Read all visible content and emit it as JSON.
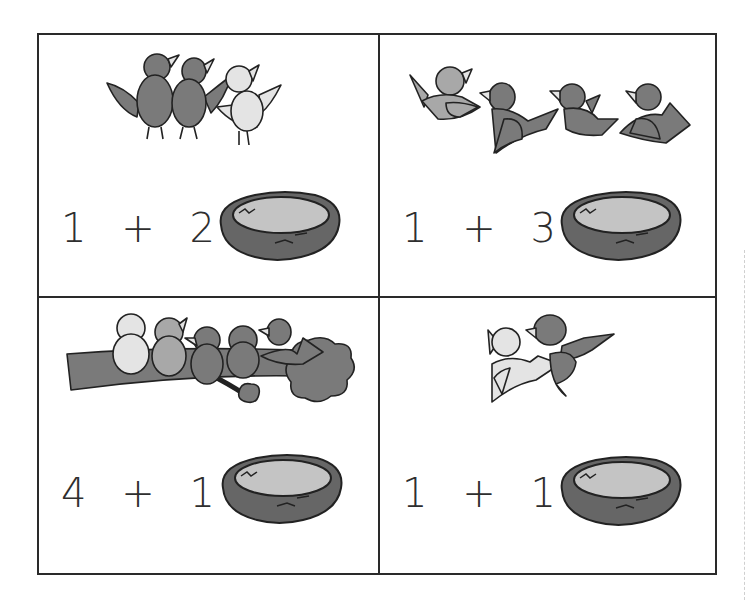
{
  "worksheet": {
    "colors": {
      "border": "#2a2a2a",
      "bird_light": "#e4e4e4",
      "bird_medium": "#a8a8a8",
      "bird_dark": "#7a7a7a",
      "nest_outer": "#666666",
      "nest_inner": "#c4c4c4"
    },
    "cells": [
      {
        "position": "top-left",
        "scene": "3 birds standing (2 dark, 1 light)",
        "equation": {
          "a": "1",
          "op": "+",
          "b": "2",
          "eq": "="
        },
        "nest_icon": "empty-nest"
      },
      {
        "position": "top-right",
        "scene": "4 birds flying (1 medium, 3 dark)",
        "equation": {
          "a": "1",
          "op": "+",
          "b": "3",
          "eq": "="
        },
        "nest_icon": "empty-nest"
      },
      {
        "position": "bottom-left",
        "scene": "4 birds on a branch plus 1 bird flying in",
        "equation": {
          "a": "4",
          "op": "+",
          "b": "1",
          "eq": "="
        },
        "nest_icon": "empty-nest"
      },
      {
        "position": "bottom-right",
        "scene": "2 birds flying (1 light, 1 dark)",
        "equation": {
          "a": "1",
          "op": "+",
          "b": "1",
          "eq": "="
        },
        "nest_icon": "empty-nest"
      }
    ]
  }
}
